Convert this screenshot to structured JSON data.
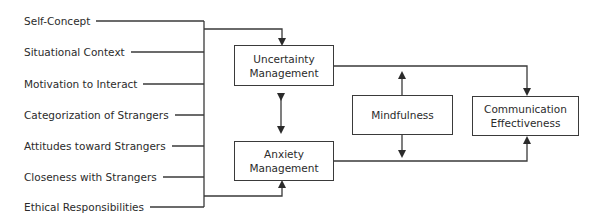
{
  "diagram": {
    "inputs": [
      {
        "label": "Self-Concept",
        "y": 21
      },
      {
        "label": "Situational Context",
        "y": 52
      },
      {
        "label": "Motivation to Interact",
        "y": 84
      },
      {
        "label": "Categorization of Strangers",
        "y": 115
      },
      {
        "label": "Attitudes toward Strangers",
        "y": 146
      },
      {
        "label": "Closeness with Strangers",
        "y": 177
      },
      {
        "label": "Ethical Responsibilities",
        "y": 207
      }
    ],
    "boxes": {
      "uncertainty": {
        "line1": "Uncertainty",
        "line2": "Management"
      },
      "anxiety": {
        "line1": "Anxiety",
        "line2": "Management"
      },
      "mindfulness": {
        "line1": "Mindfulness"
      },
      "communication": {
        "line1": "Communication",
        "line2": "Effectiveness"
      }
    },
    "colors": {
      "line": "#3a3a3a",
      "text": "#2b2b2b",
      "background": "#ffffff"
    }
  }
}
